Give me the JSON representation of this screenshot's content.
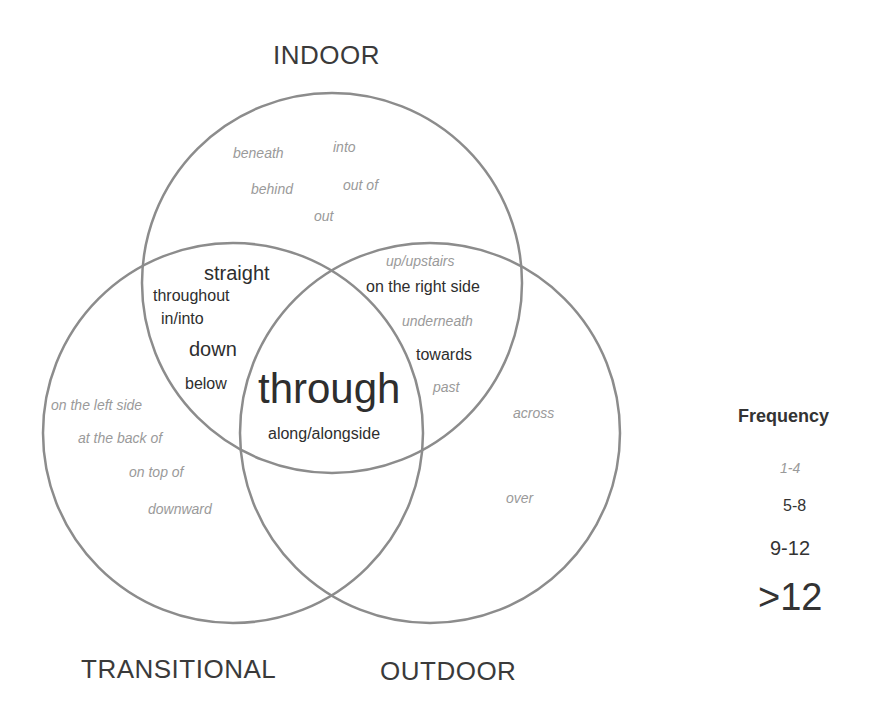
{
  "sets": {
    "indoor": "INDOOR",
    "transitional": "TRANSITIONAL",
    "outdoor": "OUTDOOR"
  },
  "colors": {
    "circle_stroke": "#8c8c8c",
    "freq_low": "#9a9a9a",
    "freq_high": "#2e2e2e"
  },
  "regions": {
    "indoor_only": [
      "beneath",
      "into",
      "behind",
      "out of",
      "out"
    ],
    "indoor_transitional": [
      "straight",
      "throughout",
      "in/into",
      "down",
      "below"
    ],
    "indoor_outdoor": [
      "up/upstairs",
      "on the right side",
      "underneath",
      "towards",
      "past"
    ],
    "all_three": [
      "through",
      "along/alongside"
    ],
    "transitional_only": [
      "on the left side",
      "at the back of",
      "on top of",
      "downward"
    ],
    "outdoor_only": [
      "across",
      "over"
    ]
  },
  "words": {
    "beneath": "beneath",
    "into": "into",
    "behind": "behind",
    "out_of": "out of",
    "out": "out",
    "straight": "straight",
    "throughout": "throughout",
    "in_into": "in/into",
    "down": "down",
    "below": "below",
    "up_upstairs": "up/upstairs",
    "on_the_right_side": "on the right side",
    "underneath": "underneath",
    "towards": "towards",
    "past": "past",
    "through": "through",
    "along_alongside": "along/alongside",
    "on_the_left_side": "on the left side",
    "at_the_back_of": "at the back of",
    "on_top_of": "on top of",
    "downward": "downward",
    "across": "across",
    "over": "over"
  },
  "legend": {
    "title": "Frequency",
    "levels": [
      "1-4",
      "5-8",
      "9-12",
      ">12"
    ]
  }
}
